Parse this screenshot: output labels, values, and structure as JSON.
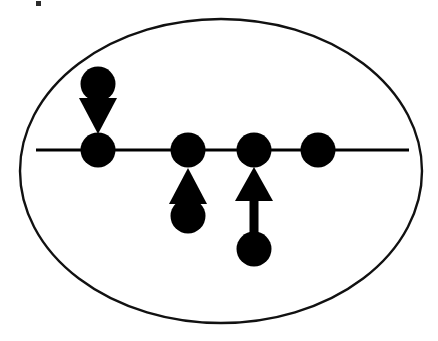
{
  "figure": {
    "width": 438,
    "height": 341,
    "background_color": "#ffffff",
    "ink_color": "#000000"
  },
  "boundary": {
    "shape_name": "ellipse-boundary",
    "cx": 221,
    "cy": 171,
    "rx": 201,
    "ry": 152,
    "stroke_color": "#111111",
    "stroke_width": 2.4,
    "fill": "none"
  },
  "axis_line": {
    "shape_name": "horizontal-axis-line",
    "x1": 36,
    "y1": 150,
    "x2": 409,
    "y2": 150,
    "stroke_color": "#000000",
    "stroke_width": 3
  },
  "nodes": [
    {
      "id": "node-1",
      "label": "on-line-node-1",
      "cx": 98,
      "cy": 150,
      "r": 17.5,
      "fill": "#000000",
      "on_axis": true
    },
    {
      "id": "node-2",
      "label": "on-line-node-2",
      "cx": 188,
      "cy": 150,
      "r": 17.5,
      "fill": "#000000",
      "on_axis": true
    },
    {
      "id": "node-3",
      "label": "on-line-node-3",
      "cx": 254,
      "cy": 150,
      "r": 17.5,
      "fill": "#000000",
      "on_axis": true
    },
    {
      "id": "node-4",
      "label": "on-line-node-4",
      "cx": 318,
      "cy": 150,
      "r": 17.5,
      "fill": "#000000",
      "on_axis": true
    },
    {
      "id": "node-5",
      "label": "off-line-node-above-1",
      "cx": 98,
      "cy": 84,
      "r": 17.5,
      "fill": "#000000",
      "on_axis": false
    },
    {
      "id": "node-6",
      "label": "off-line-node-below-2",
      "cx": 188,
      "cy": 216,
      "r": 17.5,
      "fill": "#000000",
      "on_axis": false
    },
    {
      "id": "node-7",
      "label": "off-line-node-below-3",
      "cx": 254,
      "cy": 249,
      "r": 17.5,
      "fill": "#000000",
      "on_axis": false
    }
  ],
  "arrows": [
    {
      "id": "arrow-1",
      "label": "downward-arrow-into-node-1",
      "direction": "down",
      "from_node": "node-5",
      "to_node": "node-1",
      "x": 98,
      "head_top_y": 98,
      "head_bottom_y": 134,
      "head_half_width": 19,
      "shaft_top_y": 98,
      "shaft_bottom_y": 98,
      "shaft_width": 0,
      "fill": "#000000"
    },
    {
      "id": "arrow-2",
      "label": "upward-arrow-into-node-2",
      "direction": "up",
      "from_node": "node-6",
      "to_node": "node-2",
      "x": 188,
      "head_top_y": 168,
      "head_bottom_y": 204,
      "head_half_width": 19,
      "shaft_top_y": 204,
      "shaft_bottom_y": 204,
      "shaft_width": 0,
      "fill": "#000000"
    },
    {
      "id": "arrow-3",
      "label": "upward-long-arrow-into-node-3",
      "direction": "up",
      "from_node": "node-7",
      "to_node": "node-3",
      "x": 254,
      "head_top_y": 167,
      "head_bottom_y": 201,
      "head_half_width": 19,
      "shaft_top_y": 198,
      "shaft_bottom_y": 249,
      "shaft_width": 9,
      "fill": "#000000"
    }
  ],
  "artifacts": [
    {
      "id": "speck-1",
      "label": "scan-speck-top-left",
      "x": 36,
      "y": 1,
      "width": 5,
      "height": 5,
      "fill": "#2b2b2b"
    }
  ]
}
